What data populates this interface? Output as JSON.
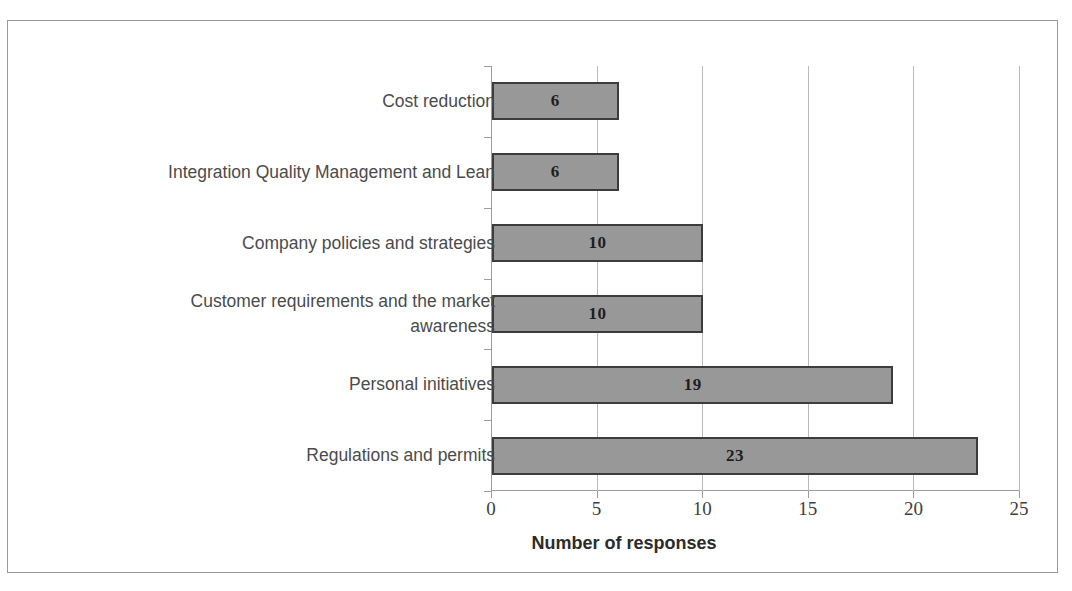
{
  "figure": {
    "clipped_title_fragment": "I",
    "frame_color": "#9a9a9a",
    "background": "#ffffff"
  },
  "chart_data": {
    "type": "bar",
    "orientation": "horizontal",
    "title": "",
    "xlabel": "Number of responses",
    "ylabel": "",
    "categories": [
      "Cost reduction",
      "Integration Quality Management and Lean",
      "Company policies and strategies",
      "Customer requirements and the market awareness",
      "Personal initiatives",
      "Regulations and permits"
    ],
    "values": [
      6,
      6,
      10,
      10,
      19,
      23
    ],
    "data_labels": [
      "6",
      "6",
      "10",
      "10",
      "19",
      "23"
    ],
    "xlim": [
      0,
      25
    ],
    "xticks": [
      0,
      5,
      10,
      15,
      20,
      25
    ],
    "xtick_labels": [
      "0",
      "5",
      "10",
      "15",
      "20",
      "25"
    ],
    "grid": "vertical",
    "legend": "none",
    "bar_fill_color": "#989898",
    "bar_border_color": "#3c3c3c",
    "gridline_color": "#b9b9b9",
    "axis_color": "#9d9d9d",
    "label_color": "#4b4b4b"
  },
  "category_label_lines": [
    [
      "Cost reduction"
    ],
    [
      "Integration Quality Management and Lean"
    ],
    [
      "Company policies and strategies"
    ],
    [
      "Customer requirements and the market",
      "awareness"
    ],
    [
      "Personal initiatives"
    ],
    [
      "Regulations and permits"
    ]
  ]
}
